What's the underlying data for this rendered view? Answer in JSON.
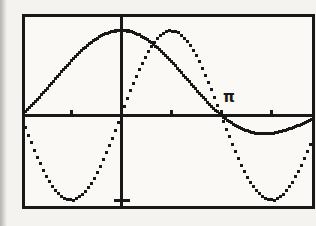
{
  "figure": {
    "ink_color": "#181818",
    "page_background": "#f4f3ef",
    "screen_background": "#faf9f5"
  },
  "chart_data": {
    "type": "line",
    "title": "",
    "xlabel": "",
    "ylabel": "",
    "xlim": [
      -3.0,
      6.0
    ],
    "ylim": [
      -1.07,
      1.15
    ],
    "grid": false,
    "legend": "none",
    "x_ticks": [
      -1.5708,
      1.5708,
      3.1416,
      4.7124
    ],
    "y_ticks": [
      -1,
      1
    ],
    "annotations": [
      {
        "text": "π",
        "x": 3.4,
        "y": 0.21
      }
    ],
    "series": [
      {
        "name": "sin(x)/x",
        "style": "solid",
        "points": [
          [
            -3.0,
            0.047
          ],
          [
            -2.7,
            0.1583
          ],
          [
            -2.4,
            0.2815
          ],
          [
            -2.1,
            0.411
          ],
          [
            -1.8,
            0.541
          ],
          [
            -1.5,
            0.665
          ],
          [
            -1.2,
            0.7767
          ],
          [
            -0.9,
            0.8703
          ],
          [
            -0.6,
            0.9411
          ],
          [
            -0.3,
            0.9851
          ],
          [
            0.0,
            1.0
          ],
          [
            0.3,
            0.9851
          ],
          [
            0.6,
            0.9411
          ],
          [
            0.9,
            0.8703
          ],
          [
            1.2,
            0.7767
          ],
          [
            1.5,
            0.665
          ],
          [
            1.8,
            0.541
          ],
          [
            2.1,
            0.411
          ],
          [
            2.4,
            0.2815
          ],
          [
            2.7,
            0.1583
          ],
          [
            3.0,
            0.047
          ],
          [
            3.3,
            -0.0478
          ],
          [
            3.6,
            -0.1229
          ],
          [
            3.9,
            -0.1764
          ],
          [
            4.2,
            -0.2075
          ],
          [
            4.5,
            -0.2172
          ],
          [
            4.8,
            -0.2075
          ],
          [
            5.1,
            -0.1815
          ],
          [
            5.4,
            -0.1431
          ],
          [
            5.7,
            -0.0966
          ],
          [
            6.0,
            -0.0466
          ]
        ]
      },
      {
        "name": "sin(x)",
        "style": "dotted",
        "points": [
          [
            -3.0,
            -0.1411
          ],
          [
            -2.7,
            -0.4274
          ],
          [
            -2.4,
            -0.6755
          ],
          [
            -2.1,
            -0.8632
          ],
          [
            -1.8,
            -0.9738
          ],
          [
            -1.5,
            -0.9975
          ],
          [
            -1.2,
            -0.932
          ],
          [
            -0.9,
            -0.7833
          ],
          [
            -0.6,
            -0.5646
          ],
          [
            -0.3,
            -0.2955
          ],
          [
            0.0,
            0.0
          ],
          [
            0.3,
            0.2955
          ],
          [
            0.6,
            0.5646
          ],
          [
            0.9,
            0.7833
          ],
          [
            1.2,
            0.932
          ],
          [
            1.5,
            0.9975
          ],
          [
            1.8,
            0.9738
          ],
          [
            2.1,
            0.8632
          ],
          [
            2.4,
            0.6755
          ],
          [
            2.7,
            0.4274
          ],
          [
            3.0,
            0.1411
          ],
          [
            3.3,
            -0.1577
          ],
          [
            3.6,
            -0.4425
          ],
          [
            3.9,
            -0.6878
          ],
          [
            4.2,
            -0.8716
          ],
          [
            4.5,
            -0.9775
          ],
          [
            4.8,
            -0.9962
          ],
          [
            5.1,
            -0.9258
          ],
          [
            5.4,
            -0.7728
          ],
          [
            5.7,
            -0.5507
          ],
          [
            6.0,
            -0.2794
          ]
        ]
      }
    ]
  }
}
